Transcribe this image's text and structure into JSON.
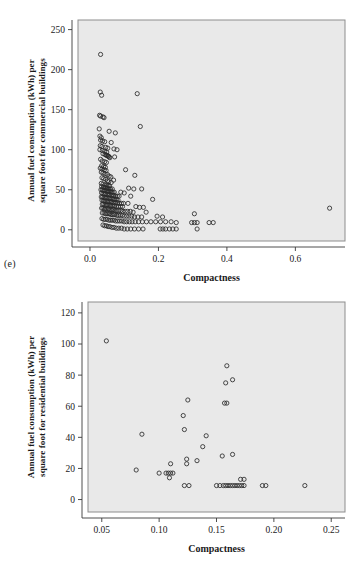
{
  "figures": [
    {
      "panel_label": "(e)",
      "name": "commercial-buildings-scatter"
    },
    {
      "panel_label": "(f)",
      "name": "residential-buildings-scatter"
    }
  ],
  "chart_data": [
    {
      "type": "scatter",
      "panel": "(e)",
      "title": "",
      "xlabel": "Compactness",
      "ylabel": "Annual fuel consumption (kWh) per square foot for commercial buildings",
      "ylabel_line1": "Annual fuel consumption (kWh) per",
      "ylabel_line2": "square foot for commercial buildings",
      "xlim": [
        -0.035,
        0.745
      ],
      "ylim": [
        -14,
        262
      ],
      "xticks": [
        0.0,
        0.2,
        0.4,
        0.6
      ],
      "xticklabels": [
        "0.0",
        "0.2",
        "0.4",
        "0.6"
      ],
      "yticks": [
        0,
        50,
        100,
        150,
        200,
        250
      ],
      "yticklabels": [
        "0",
        "50",
        "100",
        "150",
        "200",
        "250"
      ],
      "grid": false,
      "legend": false,
      "marker": "open-circle",
      "points": [
        [
          0.031,
          219
        ],
        [
          0.03,
          172
        ],
        [
          0.034,
          168
        ],
        [
          0.138,
          170
        ],
        [
          0.028,
          143
        ],
        [
          0.031,
          142
        ],
        [
          0.038,
          141
        ],
        [
          0.041,
          140
        ],
        [
          0.147,
          129
        ],
        [
          0.027,
          126
        ],
        [
          0.056,
          123
        ],
        [
          0.074,
          121
        ],
        [
          0.029,
          117
        ],
        [
          0.033,
          115
        ],
        [
          0.031,
          112
        ],
        [
          0.037,
          111
        ],
        [
          0.043,
          110
        ],
        [
          0.062,
          109
        ],
        [
          0.03,
          105
        ],
        [
          0.035,
          104
        ],
        [
          0.046,
          103
        ],
        [
          0.052,
          102
        ],
        [
          0.07,
          101
        ],
        [
          0.079,
          100
        ],
        [
          0.029,
          100
        ],
        [
          0.036,
          99
        ],
        [
          0.043,
          98
        ],
        [
          0.049,
          97
        ],
        [
          0.038,
          95
        ],
        [
          0.044,
          94
        ],
        [
          0.047,
          93
        ],
        [
          0.05,
          93
        ],
        [
          0.052,
          92
        ],
        [
          0.054,
          92
        ],
        [
          0.056,
          91
        ],
        [
          0.072,
          91
        ],
        [
          0.058,
          90
        ],
        [
          0.031,
          88
        ],
        [
          0.036,
          86
        ],
        [
          0.043,
          85
        ],
        [
          0.048,
          84
        ],
        [
          0.034,
          80
        ],
        [
          0.04,
          79
        ],
        [
          0.045,
          78
        ],
        [
          0.03,
          77
        ],
        [
          0.035,
          76
        ],
        [
          0.042,
          75
        ],
        [
          0.104,
          75
        ],
        [
          0.047,
          74
        ],
        [
          0.033,
          72
        ],
        [
          0.038,
          71
        ],
        [
          0.044,
          70
        ],
        [
          0.051,
          69
        ],
        [
          0.131,
          68
        ],
        [
          0.056,
          67
        ],
        [
          0.061,
          66
        ],
        [
          0.035,
          65
        ],
        [
          0.04,
          64
        ],
        [
          0.046,
          63
        ],
        [
          0.069,
          62
        ],
        [
          0.051,
          61
        ],
        [
          0.055,
          60
        ],
        [
          0.062,
          59
        ],
        [
          0.033,
          58
        ],
        [
          0.038,
          57
        ],
        [
          0.044,
          56
        ],
        [
          0.049,
          56
        ],
        [
          0.053,
          55
        ],
        [
          0.057,
          55
        ],
        [
          0.034,
          54
        ],
        [
          0.039,
          53
        ],
        [
          0.043,
          53
        ],
        [
          0.047,
          52
        ],
        [
          0.051,
          52
        ],
        [
          0.056,
          51
        ],
        [
          0.06,
          51
        ],
        [
          0.065,
          51
        ],
        [
          0.113,
          52
        ],
        [
          0.128,
          51
        ],
        [
          0.151,
          51
        ],
        [
          0.032,
          50
        ],
        [
          0.036,
          50
        ],
        [
          0.04,
          49
        ],
        [
          0.044,
          49
        ],
        [
          0.048,
          49
        ],
        [
          0.052,
          48
        ],
        [
          0.055,
          48
        ],
        [
          0.059,
          48
        ],
        [
          0.063,
          47
        ],
        [
          0.067,
          47
        ],
        [
          0.071,
          47
        ],
        [
          0.09,
          47
        ],
        [
          0.1,
          46
        ],
        [
          0.034,
          46
        ],
        [
          0.038,
          45
        ],
        [
          0.042,
          45
        ],
        [
          0.046,
          45
        ],
        [
          0.05,
          44
        ],
        [
          0.054,
          44
        ],
        [
          0.058,
          44
        ],
        [
          0.062,
          43
        ],
        [
          0.066,
          43
        ],
        [
          0.07,
          43
        ],
        [
          0.075,
          42
        ],
        [
          0.08,
          42
        ],
        [
          0.085,
          42
        ],
        [
          0.119,
          42
        ],
        [
          0.033,
          41
        ],
        [
          0.037,
          41
        ],
        [
          0.041,
          40
        ],
        [
          0.045,
          40
        ],
        [
          0.049,
          40
        ],
        [
          0.053,
          40
        ],
        [
          0.057,
          39
        ],
        [
          0.061,
          39
        ],
        [
          0.065,
          39
        ],
        [
          0.069,
          38
        ],
        [
          0.073,
          38
        ],
        [
          0.077,
          38
        ],
        [
          0.082,
          37
        ],
        [
          0.183,
          38
        ],
        [
          0.035,
          37
        ],
        [
          0.039,
          36
        ],
        [
          0.043,
          36
        ],
        [
          0.047,
          36
        ],
        [
          0.051,
          35
        ],
        [
          0.055,
          35
        ],
        [
          0.059,
          35
        ],
        [
          0.063,
          35
        ],
        [
          0.067,
          34
        ],
        [
          0.071,
          34
        ],
        [
          0.076,
          34
        ],
        [
          0.081,
          34
        ],
        [
          0.086,
          33
        ],
        [
          0.092,
          33
        ],
        [
          0.098,
          33
        ],
        [
          0.111,
          33
        ],
        [
          0.036,
          32
        ],
        [
          0.04,
          32
        ],
        [
          0.044,
          31
        ],
        [
          0.048,
          31
        ],
        [
          0.052,
          31
        ],
        [
          0.056,
          31
        ],
        [
          0.06,
          30
        ],
        [
          0.064,
          30
        ],
        [
          0.068,
          30
        ],
        [
          0.072,
          30
        ],
        [
          0.077,
          29
        ],
        [
          0.083,
          29
        ],
        [
          0.089,
          29
        ],
        [
          0.095,
          29
        ],
        [
          0.134,
          29
        ],
        [
          0.145,
          28
        ],
        [
          0.156,
          28
        ],
        [
          0.7,
          27
        ],
        [
          0.034,
          27
        ],
        [
          0.038,
          27
        ],
        [
          0.042,
          26
        ],
        [
          0.046,
          26
        ],
        [
          0.05,
          26
        ],
        [
          0.054,
          26
        ],
        [
          0.058,
          25
        ],
        [
          0.062,
          25
        ],
        [
          0.066,
          25
        ],
        [
          0.07,
          25
        ],
        [
          0.074,
          24
        ],
        [
          0.079,
          24
        ],
        [
          0.084,
          24
        ],
        [
          0.09,
          24
        ],
        [
          0.096,
          23
        ],
        [
          0.103,
          23
        ],
        [
          0.11,
          23
        ],
        [
          0.118,
          23
        ],
        [
          0.126,
          22
        ],
        [
          0.164,
          22
        ],
        [
          0.305,
          20
        ],
        [
          0.036,
          21
        ],
        [
          0.041,
          21
        ],
        [
          0.045,
          20
        ],
        [
          0.049,
          20
        ],
        [
          0.053,
          20
        ],
        [
          0.057,
          20
        ],
        [
          0.061,
          19
        ],
        [
          0.065,
          19
        ],
        [
          0.069,
          19
        ],
        [
          0.073,
          19
        ],
        [
          0.078,
          18
        ],
        [
          0.083,
          18
        ],
        [
          0.088,
          18
        ],
        [
          0.094,
          18
        ],
        [
          0.1,
          17
        ],
        [
          0.107,
          17
        ],
        [
          0.114,
          17
        ],
        [
          0.122,
          17
        ],
        [
          0.13,
          16
        ],
        [
          0.14,
          16
        ],
        [
          0.151,
          16
        ],
        [
          0.196,
          17
        ],
        [
          0.212,
          16
        ],
        [
          0.035,
          14
        ],
        [
          0.04,
          13
        ],
        [
          0.045,
          13
        ],
        [
          0.05,
          13
        ],
        [
          0.055,
          12
        ],
        [
          0.06,
          12
        ],
        [
          0.065,
          12
        ],
        [
          0.07,
          12
        ],
        [
          0.075,
          11
        ],
        [
          0.081,
          11
        ],
        [
          0.087,
          11
        ],
        [
          0.093,
          11
        ],
        [
          0.1,
          10
        ],
        [
          0.107,
          10
        ],
        [
          0.115,
          10
        ],
        [
          0.123,
          10
        ],
        [
          0.132,
          10
        ],
        [
          0.142,
          10
        ],
        [
          0.153,
          10
        ],
        [
          0.165,
          10
        ],
        [
          0.178,
          10
        ],
        [
          0.192,
          10
        ],
        [
          0.206,
          10
        ],
        [
          0.221,
          10
        ],
        [
          0.237,
          10
        ],
        [
          0.252,
          9
        ],
        [
          0.297,
          9
        ],
        [
          0.305,
          9
        ],
        [
          0.313,
          9
        ],
        [
          0.348,
          9
        ],
        [
          0.36,
          9
        ],
        [
          0.038,
          6
        ],
        [
          0.043,
          5
        ],
        [
          0.048,
          5
        ],
        [
          0.053,
          4
        ],
        [
          0.058,
          4
        ],
        [
          0.064,
          3
        ],
        [
          0.07,
          3
        ],
        [
          0.077,
          2
        ],
        [
          0.084,
          2
        ],
        [
          0.092,
          2
        ],
        [
          0.1,
          1
        ],
        [
          0.109,
          1
        ],
        [
          0.119,
          1
        ],
        [
          0.13,
          1
        ],
        [
          0.142,
          1
        ],
        [
          0.155,
          1
        ],
        [
          0.205,
          1
        ],
        [
          0.213,
          1
        ],
        [
          0.221,
          1
        ],
        [
          0.232,
          1
        ],
        [
          0.242,
          1
        ],
        [
          0.252,
          1
        ],
        [
          0.313,
          1
        ]
      ]
    },
    {
      "type": "scatter",
      "panel": "(f)",
      "title": "",
      "xlabel": "Compactness",
      "ylabel": "Annual fuel consumption (kWh) per square foot for residential buildings",
      "ylabel_line1": "Annual fuel consumption (kWh) per",
      "ylabel_line2": "square foot for residential buildings",
      "xlim": [
        0.038,
        0.262
      ],
      "ylim": [
        -8,
        127
      ],
      "xticks": [
        0.05,
        0.1,
        0.15,
        0.2,
        0.25
      ],
      "xticklabels": [
        "0.05",
        "0.10",
        "0.15",
        "0.20",
        "0.25"
      ],
      "yticks": [
        0,
        20,
        40,
        60,
        80,
        100,
        120
      ],
      "yticklabels": [
        "0",
        "20",
        "40",
        "60",
        "80",
        "100",
        "120"
      ],
      "grid": false,
      "legend": false,
      "marker": "open-circle",
      "points": [
        [
          0.054,
          102
        ],
        [
          0.159,
          86
        ],
        [
          0.158,
          75
        ],
        [
          0.164,
          77
        ],
        [
          0.125,
          64
        ],
        [
          0.157,
          62
        ],
        [
          0.159,
          62
        ],
        [
          0.121,
          54
        ],
        [
          0.122,
          45
        ],
        [
          0.085,
          42
        ],
        [
          0.141,
          41
        ],
        [
          0.138,
          34
        ],
        [
          0.164,
          29
        ],
        [
          0.155,
          28
        ],
        [
          0.133,
          25
        ],
        [
          0.124,
          26
        ],
        [
          0.124,
          23
        ],
        [
          0.11,
          23
        ],
        [
          0.08,
          19
        ],
        [
          0.1,
          17
        ],
        [
          0.106,
          17
        ],
        [
          0.108,
          17
        ],
        [
          0.11,
          17
        ],
        [
          0.112,
          17
        ],
        [
          0.109,
          14
        ],
        [
          0.171,
          13
        ],
        [
          0.174,
          13
        ],
        [
          0.122,
          9
        ],
        [
          0.126,
          9
        ],
        [
          0.15,
          9
        ],
        [
          0.153,
          9
        ],
        [
          0.156,
          9
        ],
        [
          0.158,
          9
        ],
        [
          0.16,
          9
        ],
        [
          0.162,
          9
        ],
        [
          0.164,
          9
        ],
        [
          0.166,
          9
        ],
        [
          0.168,
          9
        ],
        [
          0.17,
          9
        ],
        [
          0.172,
          9
        ],
        [
          0.174,
          9
        ],
        [
          0.19,
          9
        ],
        [
          0.193,
          9
        ],
        [
          0.227,
          9
        ]
      ]
    }
  ]
}
